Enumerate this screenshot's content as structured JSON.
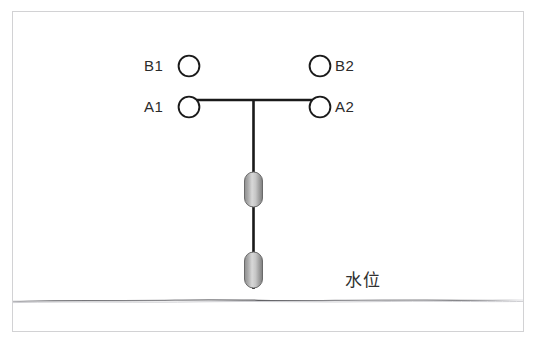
{
  "canvas": {
    "width": 535,
    "height": 347,
    "background": "#ffffff"
  },
  "frame": {
    "border_color": "#d2d2d4",
    "background": "#ffffff"
  },
  "top_clipped_text": "        ",
  "diagram": {
    "title_visible": false,
    "line_color": "#1a1a1a",
    "circle_fill": "#ffffff",
    "circle_stroke": "#1a1a1a",
    "capsule_fill_light": "#d9d9d9",
    "capsule_fill_dark": "#8e8e8e",
    "capsule_stroke": "#6f6f6f",
    "waterline_color": "#8c8c90",
    "sensors": [
      {
        "id": "B1",
        "label": "B1",
        "label_side": "left",
        "cx": 189,
        "cy": 66,
        "r": 10.5
      },
      {
        "id": "B2",
        "label": "B2",
        "label_side": "right",
        "cx": 320,
        "cy": 66,
        "r": 10.5
      },
      {
        "id": "A1",
        "label": "A1",
        "label_side": "left",
        "cx": 189,
        "cy": 107,
        "r": 10.5
      },
      {
        "id": "A2",
        "label": "A2",
        "label_side": "right",
        "cx": 320,
        "cy": 107,
        "r": 10.5
      }
    ],
    "beam": {
      "x1": 189,
      "x2": 320,
      "y": 100
    },
    "mast": {
      "x": 253,
      "y1": 100,
      "y2": 288
    },
    "floats": [
      {
        "name": "upper-float",
        "cx": 253,
        "top": 172,
        "bottom": 207,
        "width": 18
      },
      {
        "name": "lower-float",
        "cx": 253,
        "top": 252,
        "bottom": 288,
        "width": 18
      }
    ],
    "waterline": {
      "y": 300,
      "x1": 13,
      "x2": 523
    },
    "waterlevel_label": "水位"
  }
}
